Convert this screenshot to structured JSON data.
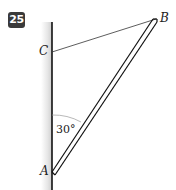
{
  "problem_number": "25",
  "labels": {
    "A": "A",
    "B": "B",
    "C": "C",
    "angle": "30°"
  },
  "colors": {
    "badge_bg": "#3a3a3a",
    "line": "#222222",
    "wall_shade": "#cfcfcf"
  }
}
